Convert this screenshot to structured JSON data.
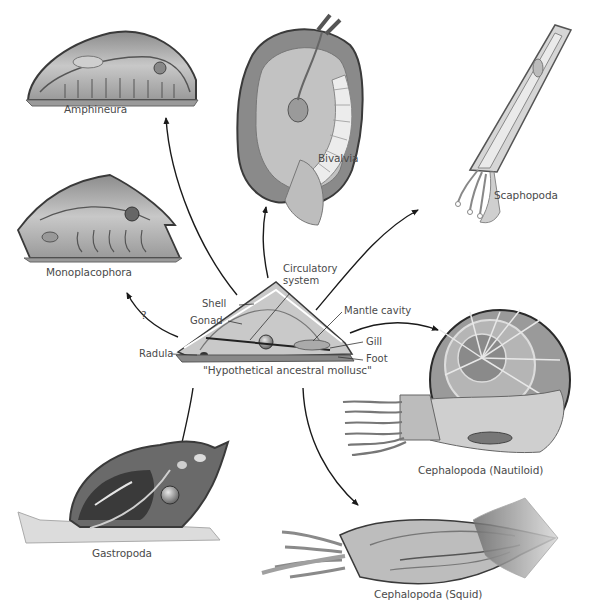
{
  "diagram": {
    "center": {
      "label": "\"Hypothetical ancestral mollusc\"",
      "parts": {
        "circulatory": "Circulatory",
        "system": "system",
        "shell": "Shell",
        "gonad": "Gonad",
        "radula": "Radula",
        "mantle_cavity": "Mantle cavity",
        "gill": "Gill",
        "foot": "Foot"
      }
    },
    "groups": [
      {
        "id": "amphineura",
        "label": "Amphineura"
      },
      {
        "id": "bivalvia",
        "label": "Bivalvia"
      },
      {
        "id": "scaphopoda",
        "label": "Scaphopoda"
      },
      {
        "id": "monoplacophora",
        "label": "Monoplacophora",
        "uncertain_marker": "?"
      },
      {
        "id": "nautiloid",
        "label": "Cephalopoda (Nautiloid)"
      },
      {
        "id": "gastropoda",
        "label": "Gastropoda"
      },
      {
        "id": "squid",
        "label": "Cephalopoda (Squid)"
      }
    ],
    "colors": {
      "line": "#1a1a1a",
      "label": "#4a4a4a",
      "body_light": "#d9d9d9",
      "body_mid": "#a6a6a6",
      "body_dark": "#5a5a5a"
    }
  }
}
